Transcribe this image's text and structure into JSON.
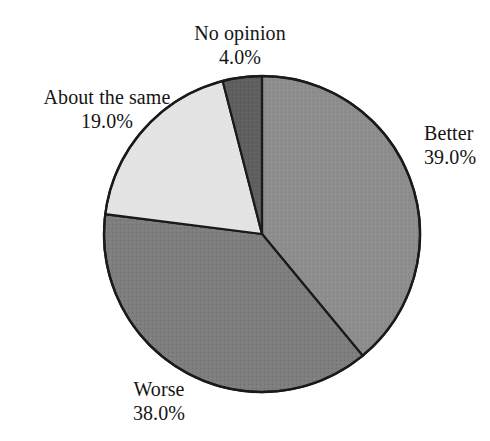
{
  "chart_data": {
    "type": "pie",
    "title": "",
    "subtitle": "",
    "xlabel": "",
    "ylabel": "",
    "legend_position": "none",
    "grid": false,
    "labels_show_percent": true,
    "start_angle_deg": 90,
    "direction": "clockwise",
    "categories": [
      "Better",
      "Worse",
      "About the same",
      "No opinion"
    ],
    "values": [
      39.0,
      38.0,
      19.0,
      4.0
    ],
    "value_labels": [
      "39.0%",
      "38.0%",
      "19.0%",
      "4.0%"
    ],
    "units": "percent",
    "total": 100.0,
    "slices": [
      {
        "label": "Better",
        "value": 39.0,
        "value_label": "39.0%",
        "color": "#8d8d8d",
        "sweep_deg": 140.4,
        "start_deg": 90.0,
        "end_deg": -50.4
      },
      {
        "label": "Worse",
        "value": 38.0,
        "value_label": "38.0%",
        "color": "#7e7e7e",
        "sweep_deg": 136.8,
        "start_deg": -50.4,
        "end_deg": -187.2
      },
      {
        "label": "About the same",
        "value": 19.0,
        "value_label": "19.0%",
        "color": "#e4e4e4",
        "sweep_deg": 68.4,
        "start_deg": -187.2,
        "end_deg": -255.6
      },
      {
        "label": "No opinion",
        "value": 4.0,
        "value_label": "4.0%",
        "color": "#5f5f5f",
        "sweep_deg": 14.4,
        "start_deg": -255.6,
        "end_deg": -270.0
      }
    ]
  },
  "pie": {
    "center_x": 262,
    "center_y": 234,
    "radius": 158,
    "outline_color": "#1a1a1a",
    "background": "#ffffff"
  },
  "labels": {
    "better": {
      "name": "Better",
      "value": "39.0%"
    },
    "worse": {
      "name": "Worse",
      "value": "38.0%"
    },
    "about_the_same": {
      "name": "About the same",
      "value": "19.0%"
    },
    "no_opinion": {
      "name": "No opinion",
      "value": "4.0%"
    }
  }
}
